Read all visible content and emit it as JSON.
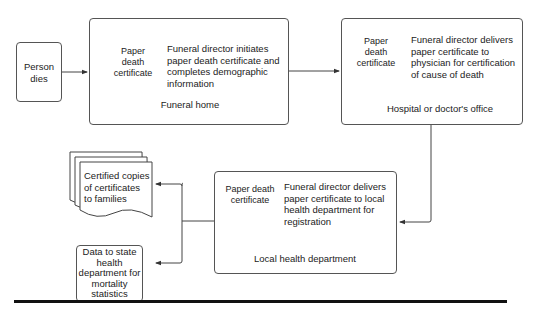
{
  "diagram": {
    "nodes": {
      "person_dies": {
        "label": "Person dies"
      },
      "funeral_home": {
        "doc_label": "Paper death certificate",
        "description": "Funeral director initiates paper death certificate and completes demographic information",
        "location": "Funeral home"
      },
      "hospital": {
        "doc_label": "Paper death certificate",
        "description": "Funeral director delivers paper certificate to physician for certification of cause of death",
        "location": "Hospital or doctor's office"
      },
      "local_health": {
        "doc_label": "Paper death certificate",
        "description": "Funeral director delivers paper certificate to local health department for registration",
        "location": "Local health department"
      },
      "certified_copies": {
        "label": "Certified copies of certificates to families"
      },
      "state_data": {
        "label": "Data to state health department for mortality statistics"
      }
    },
    "edges": [
      {
        "from": "person_dies",
        "to": "funeral_home"
      },
      {
        "from": "funeral_home",
        "to": "hospital"
      },
      {
        "from": "hospital",
        "to": "local_health"
      },
      {
        "from": "local_health",
        "to": "certified_copies"
      },
      {
        "from": "local_health",
        "to": "state_data"
      }
    ]
  }
}
